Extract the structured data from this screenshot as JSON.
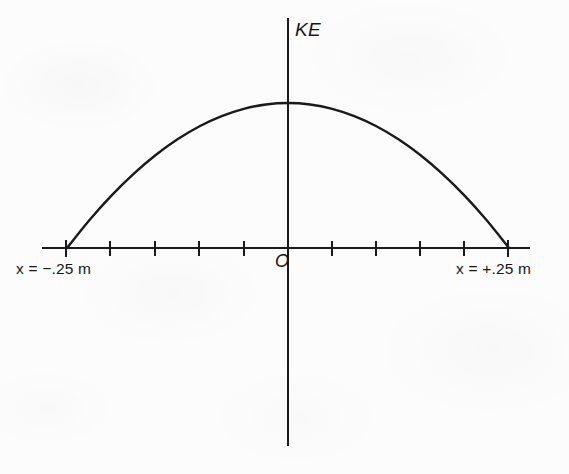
{
  "figure": {
    "background_color": "#fcfcfc",
    "ink_color": "#1a1a1d"
  },
  "labels": {
    "y_axis": "KE",
    "origin": "O",
    "left_endpoint": "x = −.25 m",
    "right_endpoint": "x = +.25 m"
  },
  "chart_data": {
    "type": "line",
    "title": "",
    "subtitle": "",
    "xlabel": "",
    "ylabel": "KE",
    "grid": false,
    "legend": null,
    "annotations": [
      {
        "text": "KE",
        "position": "top-of-vertical-axis"
      },
      {
        "text": "O",
        "position": "origin-right-below-axis"
      },
      {
        "text": "x = −.25 m",
        "position": "below-left-endpoint"
      },
      {
        "text": "x = +.25 m",
        "position": "below-right-endpoint"
      }
    ],
    "xlim": [
      -0.3,
      0.3
    ],
    "ylim": [
      0,
      1
    ],
    "x_tick_values": [
      -0.25,
      -0.2,
      -0.15,
      -0.1,
      -0.05,
      0,
      0.05,
      0.1,
      0.15,
      0.2,
      0.25
    ],
    "x_tick_labels": [
      "",
      "",
      "",
      "",
      "",
      "",
      "",
      "",
      "",
      "",
      ""
    ],
    "y_tick_values": [],
    "y_tick_labels": [],
    "series": [
      {
        "name": "KE(x)",
        "equation": "KE = KE_max * (1 - (x/0.25)^2)",
        "x": [
          -0.25,
          -0.225,
          -0.2,
          -0.175,
          -0.15,
          -0.125,
          -0.1,
          -0.075,
          -0.05,
          -0.025,
          0,
          0.025,
          0.05,
          0.075,
          0.1,
          0.125,
          0.15,
          0.175,
          0.2,
          0.225,
          0.25
        ],
        "y": [
          0,
          0.19,
          0.36,
          0.51,
          0.64,
          0.75,
          0.84,
          0.91,
          0.96,
          0.99,
          1,
          0.99,
          0.96,
          0.91,
          0.84,
          0.75,
          0.64,
          0.51,
          0.36,
          0.19,
          0
        ]
      }
    ]
  }
}
